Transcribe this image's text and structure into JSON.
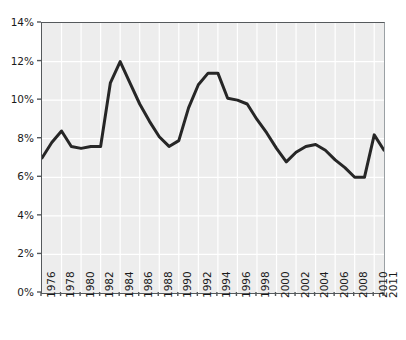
{
  "chart_data": {
    "type": "line",
    "title": "",
    "subtitle": "",
    "xlabel": "",
    "ylabel": "",
    "xlim": [
      1976,
      2011
    ],
    "ylim": [
      0,
      14
    ],
    "grid": true,
    "legend": null,
    "y_tick_labels": [
      "0%",
      "2%",
      "4%",
      "6%",
      "8%",
      "10%",
      "12%",
      "14%"
    ],
    "y_tick_values": [
      0,
      2,
      4,
      6,
      8,
      10,
      12,
      14
    ],
    "x_tick_labels": [
      "1976",
      "1978",
      "1980",
      "1982",
      "1984",
      "1986",
      "1988",
      "1990",
      "1992",
      "1994",
      "1996",
      "1998",
      "2000",
      "2002",
      "2004",
      "2006",
      "2008",
      "2010",
      "2011"
    ],
    "x_tick_values": [
      1976,
      1978,
      1980,
      1982,
      1984,
      1986,
      1988,
      1990,
      1992,
      1994,
      1996,
      1998,
      2000,
      2002,
      2004,
      2006,
      2008,
      2010,
      2011
    ],
    "series": [
      {
        "name": "rate",
        "color": "#262626",
        "line_width": 3,
        "x": [
          1976,
          1977,
          1978,
          1979,
          1980,
          1981,
          1982,
          1983,
          1984,
          1985,
          1986,
          1987,
          1988,
          1989,
          1990,
          1991,
          1992,
          1993,
          1994,
          1995,
          1996,
          1997,
          1998,
          1999,
          2000,
          2001,
          2002,
          2003,
          2004,
          2005,
          2006,
          2007,
          2008,
          2009,
          2010,
          2011
        ],
        "values": [
          7.0,
          7.8,
          8.4,
          7.6,
          7.5,
          7.6,
          7.6,
          10.9,
          12.0,
          10.9,
          9.8,
          8.9,
          8.1,
          7.6,
          7.9,
          9.6,
          10.8,
          11.4,
          11.4,
          10.1,
          10.0,
          9.8,
          9.0,
          8.3,
          7.5,
          6.8,
          7.3,
          7.6,
          7.7,
          7.4,
          6.9,
          6.5,
          6.0,
          6.0,
          8.2,
          7.4
        ]
      }
    ],
    "plot_background": "#ededed",
    "grid_color": "#ffffff",
    "axis_color": "#55595c",
    "page_background": "#ffffff"
  }
}
